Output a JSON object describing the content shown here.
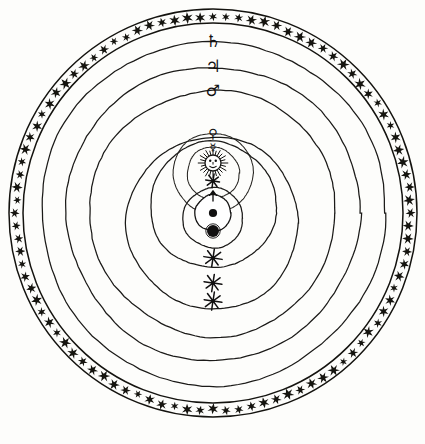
{
  "figure": {
    "kind": "astronomical-cosmological-diagram",
    "background_color": "#fdfdfb",
    "ink_color": "#14130f",
    "width": 425,
    "height": 444
  },
  "center": {
    "x": 213,
    "y": 213
  },
  "firmament_band": {
    "name": "sphere-of-fixed-stars",
    "outer_radius": 204,
    "inner_radius": 190,
    "star_count": 96,
    "star_glyph": "six-pointed-star",
    "label": "Firmament of the Fixed Stars"
  },
  "orbits": [
    {
      "id": "saturn-orbit",
      "label": "Saturn",
      "symbol": "♄",
      "radius": 172,
      "center_offset_y": 0,
      "marker_angle_deg": -90,
      "marker_type": "planet-symbol"
    },
    {
      "id": "jupiter-orbit",
      "label": "Jupiter",
      "symbol": "♃",
      "radius": 147,
      "center_offset_y": 0,
      "marker_angle_deg": -90,
      "marker_type": "planet-symbol"
    },
    {
      "id": "mars-orbit",
      "label": "Mars",
      "symbol": "♂",
      "radius": 123,
      "center_offset_y": 0,
      "marker_angle_deg": -90,
      "marker_type": "planet-symbol"
    },
    {
      "id": "venus-orbit",
      "label": "Venus",
      "symbol": "♀",
      "radius": 40,
      "center_offset_y": -40,
      "marker_angle_deg": -90,
      "marker_type": "planet-symbol"
    },
    {
      "id": "mercury-orbit",
      "label": "Mercury",
      "symbol": "☿",
      "radius": 26,
      "center_offset_y": -40,
      "marker_angle_deg": -90,
      "marker_type": "planet-symbol"
    },
    {
      "id": "lunar-orbit",
      "label": "Moon",
      "symbol": "☾",
      "radius": 30,
      "center_offset_y": 5,
      "marker_angle_deg": 90,
      "marker_type": "dark-disc"
    }
  ],
  "solar_orbits": [
    {
      "id": "solar-orbit-inner",
      "label": "Inner solar circuit",
      "radius": 63,
      "center_offset_y": -8
    },
    {
      "id": "solar-orbit-outer",
      "label": "Outer solar circuit",
      "radius": 86,
      "center_offset_y": 10
    }
  ],
  "bodies": [
    {
      "id": "sun",
      "label": "Sun",
      "symbol": "☉",
      "x": 213,
      "y": 163,
      "radius": 8,
      "style": "radiant-face",
      "ray_count": 24
    },
    {
      "id": "earth",
      "label": "Earth",
      "symbol": "⊕",
      "x": 213,
      "y": 213,
      "radius": 18,
      "style": "circle-with-centre-dot"
    },
    {
      "id": "moon",
      "label": "Moon",
      "symbol": "☽",
      "x": 213,
      "y": 231,
      "radius": 6,
      "style": "dark-disc"
    }
  ],
  "star_markers": [
    {
      "id": "star-marker-venus-orbit",
      "x": 213,
      "y": 181,
      "size": 7,
      "points": 8,
      "label": "star on Venus orbit"
    },
    {
      "id": "star-marker-solar-inner",
      "x": 213,
      "y": 258,
      "size": 9,
      "points": 8,
      "label": "star on inner solar circuit"
    },
    {
      "id": "star-marker-solar-outer",
      "x": 213,
      "y": 283,
      "size": 9,
      "points": 8,
      "label": "star on outer solar circuit"
    },
    {
      "id": "star-marker-mars-orbit",
      "x": 213,
      "y": 301,
      "size": 9,
      "points": 8,
      "label": "star on Mars orbit"
    }
  ],
  "arrow_markers": [
    {
      "id": "lunar-node-arrow",
      "x": 213,
      "y": 196,
      "direction": "up",
      "label": "ascending node marker"
    }
  ],
  "legend": {
    "planet_symbols": [
      {
        "name": "Saturn",
        "symbol": "♄"
      },
      {
        "name": "Jupiter",
        "symbol": "♃"
      },
      {
        "name": "Mars",
        "symbol": "♂"
      },
      {
        "name": "Venus",
        "symbol": "♀"
      },
      {
        "name": "Mercury",
        "symbol": "☿"
      },
      {
        "name": "Sun",
        "symbol": "☉"
      },
      {
        "name": "Earth",
        "symbol": "⊕"
      },
      {
        "name": "Moon",
        "symbol": "☽"
      }
    ]
  }
}
